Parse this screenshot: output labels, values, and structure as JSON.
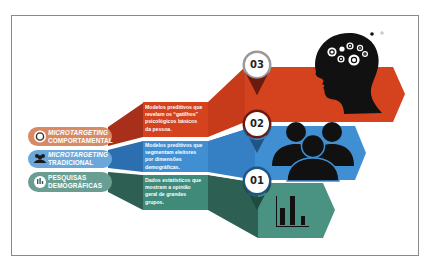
{
  "colors": {
    "orange": "#d4421e",
    "orange_dark": "#a8301a",
    "orange_pill": "#d98a63",
    "blue": "#3f8fd2",
    "blue_dark": "#2c6fb0",
    "blue_pill": "#6aa8dc",
    "teal": "#3f8a78",
    "teal_dark": "#2d5f52",
    "teal_pill": "#6b9e93",
    "black": "#111111",
    "frame": "#8a8a8a"
  },
  "levels": [
    {
      "number": "01",
      "category_line1": "PESQUISAS",
      "category_line2": "DEMOGRÁFICAS",
      "category_icon": "bar-chart-icon",
      "description": [
        "Dados estatísticos que",
        "mostram a opinião",
        "geral de grandes",
        "grupos."
      ],
      "illustration": "bar-chart-icon"
    },
    {
      "number": "02",
      "category_line1": "MICROTARGETING",
      "category_line2": "TRADICIONAL",
      "category_icon": "people-group-icon",
      "description": [
        "Modelos preditivos que",
        "segmentam eleitores",
        "por dimensões",
        "demográficas."
      ],
      "illustration": "people-group-icon"
    },
    {
      "number": "03",
      "category_line1": "MICROTARGETING",
      "category_line2": "COMPORTAMENTAL",
      "category_icon": "target-ring-icon",
      "description": [
        "Modelos preditivos que",
        "revelam os “gatilhos”",
        "psicológicos básicos",
        "da pessoa."
      ],
      "illustration": "head-with-gears-icon"
    }
  ]
}
